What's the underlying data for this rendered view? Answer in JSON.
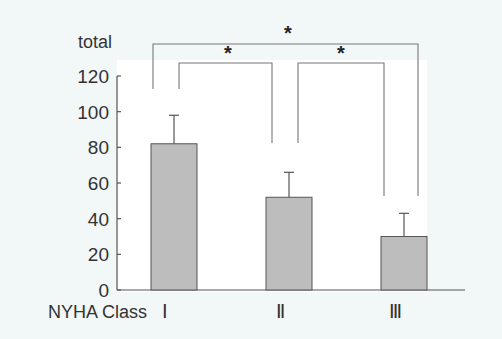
{
  "chart_data": {
    "type": "bar",
    "title": "",
    "ylabel": "total",
    "xlabel": "NYHA Class",
    "categories": [
      "Ⅰ",
      "Ⅱ",
      "Ⅲ"
    ],
    "values": [
      82,
      52,
      30
    ],
    "error_upper": [
      98,
      66,
      43
    ],
    "ylim": [
      0,
      120
    ],
    "yticks": [
      0,
      20,
      40,
      60,
      80,
      100,
      120
    ],
    "grid": false,
    "legend": null,
    "bar_color": "#bdbdbd",
    "significance": [
      {
        "from": 0,
        "to": 1,
        "label": "*"
      },
      {
        "from": 1,
        "to": 2,
        "label": "*"
      },
      {
        "from": 0,
        "to": 2,
        "label": "*"
      }
    ]
  },
  "colors": {
    "background": "#f2f7f8",
    "plot_background": "#ffffff",
    "axis": "#555555",
    "bar_fill": "#bdbdbd",
    "bar_stroke": "#555555"
  }
}
